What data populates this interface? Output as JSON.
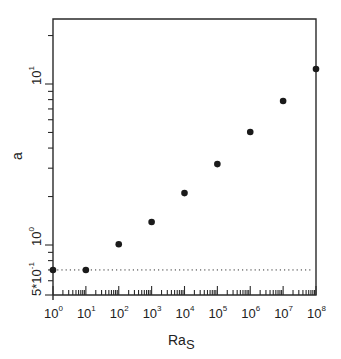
{
  "chart_data": {
    "type": "scatter",
    "title": "",
    "xlabel": "Ra",
    "xlabel_subscript": "S",
    "ylabel": "a",
    "xscale": "log",
    "yscale": "log",
    "xlim": [
      1,
      100000000
    ],
    "ylim": [
      0.5,
      25
    ],
    "grid": false,
    "legend": null,
    "x_ticks": [
      {
        "value": 1,
        "base": "10",
        "exp": "0"
      },
      {
        "value": 10,
        "base": "10",
        "exp": "1"
      },
      {
        "value": 100,
        "base": "10",
        "exp": "2"
      },
      {
        "value": 1000,
        "base": "10",
        "exp": "3"
      },
      {
        "value": 10000,
        "base": "10",
        "exp": "4"
      },
      {
        "value": 100000,
        "base": "10",
        "exp": "5"
      },
      {
        "value": 1000000,
        "base": "10",
        "exp": "6"
      },
      {
        "value": 10000000,
        "base": "10",
        "exp": "7"
      },
      {
        "value": 100000000,
        "base": "10",
        "exp": "8"
      }
    ],
    "y_ticks": [
      {
        "value": 0.5,
        "base": "5*10",
        "exp": "-1"
      },
      {
        "value": 1,
        "base": "10",
        "exp": "0"
      },
      {
        "value": 10,
        "base": "10",
        "exp": "1"
      }
    ],
    "series": [
      {
        "name": "a vs Ra_S",
        "marker": "filled-circle",
        "x": [
          1,
          10,
          100,
          1000,
          10000,
          100000,
          1000000,
          10000000,
          100000000
        ],
        "y": [
          0.7,
          0.7,
          1.01,
          1.39,
          2.1,
          3.18,
          5.03,
          7.84,
          12.4
        ]
      }
    ],
    "reference_lines": [
      {
        "orientation": "horizontal",
        "y": 0.7,
        "style": "dotted"
      }
    ]
  }
}
